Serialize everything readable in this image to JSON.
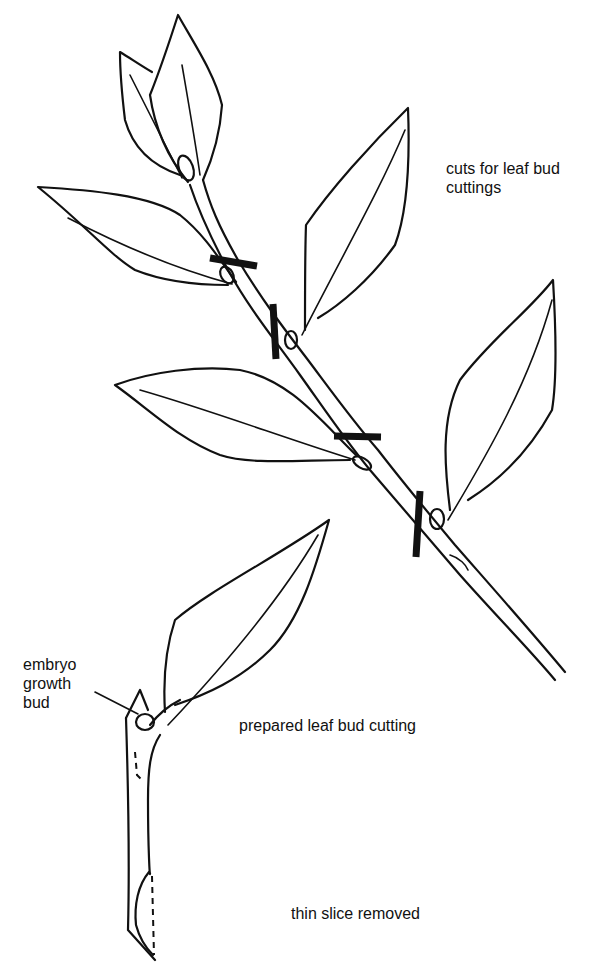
{
  "diagram": {
    "subject": "Leaf bud cuttings",
    "labels": {
      "cuts": [
        "cuts for leaf bud",
        "cuttings"
      ],
      "embryo": [
        "embryo",
        "growth",
        "bud"
      ],
      "prepared": "prepared leaf bud cutting",
      "slice": "thin slice removed"
    },
    "parts": {
      "upper": "shoot with leaves and four cut marks",
      "lower": "single prepared leaf bud cutting"
    },
    "cut_marks_count": 4,
    "colors": {
      "ink": "#111111",
      "background": "#ffffff"
    }
  }
}
